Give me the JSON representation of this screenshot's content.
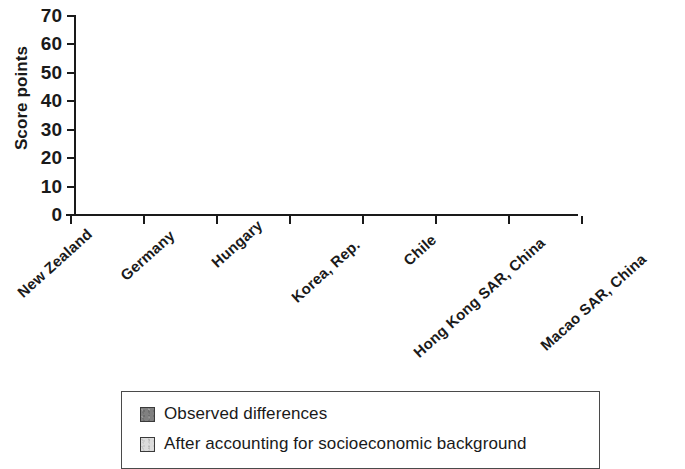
{
  "chart_data": {
    "type": "bar",
    "stacked": true,
    "title": "",
    "xlabel": "",
    "ylabel": "Score points",
    "ylim": [
      0,
      70
    ],
    "yticks": [
      0,
      10,
      20,
      30,
      40,
      50,
      60,
      70
    ],
    "ytick_labels": [
      "0",
      "10",
      "20",
      "30",
      "40",
      "50",
      "60",
      "70"
    ],
    "grid": false,
    "legend_position": "bottom",
    "categories": [
      "New Zealand",
      "Germany",
      "Hungary",
      "Korea, Rep.",
      "Chile",
      "Hong Kong SAR, China",
      "Macao SAR, China"
    ],
    "series": [
      {
        "name": "After accounting for socioeconomic background",
        "color": "#dcdcdc",
        "values": [
          42,
          29.5,
          19,
          12.5,
          12.5,
          0,
          0
        ]
      },
      {
        "name": "Observed differences",
        "color": "#808080",
        "values": [
          21,
          22,
          12,
          10,
          6,
          12.5,
          8.5
        ]
      }
    ],
    "totals": [
      63,
      51.5,
      31,
      22.5,
      18.5,
      12.5,
      8.5
    ]
  },
  "axis": {
    "y_title": "Score points"
  },
  "legend": {
    "items": [
      {
        "label": "Observed differences",
        "swatch": "dark-gray-swatch",
        "color": "#808080"
      },
      {
        "label": "After accounting for socioeconomic background",
        "swatch": "light-gray-swatch",
        "color": "#dcdcdc"
      }
    ]
  }
}
